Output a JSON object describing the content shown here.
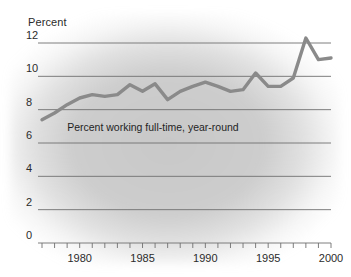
{
  "chart_data": {
    "type": "line",
    "title": "",
    "xlabel": "",
    "ylabel": "Percent",
    "ylim": [
      0,
      12.8
    ],
    "xlim": [
      1977,
      2000
    ],
    "grid": true,
    "legend_position": "inline-annotation",
    "yticks": [
      0,
      2,
      4,
      6,
      8,
      10,
      12
    ],
    "ytick_labels": [
      "0",
      "2",
      "4",
      "6",
      "8",
      "10",
      "12"
    ],
    "xticks": [
      1980,
      1985,
      1990,
      1995,
      2000
    ],
    "xtick_labels": [
      "1980",
      "1985",
      "1990",
      "1995",
      "2000"
    ],
    "minor_xtick_interval": 1,
    "annotations": [
      {
        "text": "Percent working full-time, year-round",
        "x": 1979.0,
        "y": 6.9
      }
    ],
    "series": [
      {
        "name": "Percent working full-time, year-round",
        "color": "#8a8a8a",
        "x": [
          1977,
          1978,
          1979,
          1980,
          1981,
          1982,
          1983,
          1984,
          1985,
          1986,
          1987,
          1988,
          1989,
          1990,
          1991,
          1992,
          1993,
          1994,
          1995,
          1996,
          1997,
          1998,
          1999,
          2000
        ],
        "values": [
          7.4,
          7.8,
          8.3,
          8.7,
          8.9,
          8.8,
          8.9,
          9.5,
          9.1,
          9.55,
          8.6,
          9.1,
          9.4,
          9.65,
          9.4,
          9.1,
          9.2,
          10.2,
          9.4,
          9.4,
          9.9,
          12.3,
          11.0,
          11.1
        ]
      }
    ]
  },
  "axis": {
    "y_title": "Percent"
  }
}
